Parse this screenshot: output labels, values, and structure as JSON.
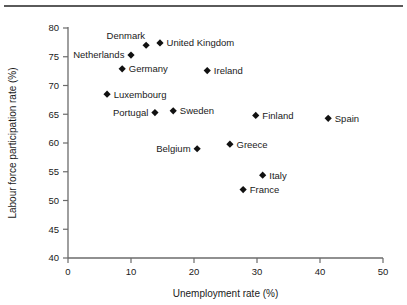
{
  "figure": {
    "has_top_rule": true,
    "background_color": "#ffffff",
    "marker_color": "#111111",
    "axis_color": "#6b6b6b",
    "text_color": "#1a1a1a"
  },
  "chart_data": {
    "type": "scatter",
    "title": "",
    "xlabel": "Unemployment rate (%)",
    "ylabel": "Labour force participation rate (%)",
    "xlim": [
      0,
      50
    ],
    "ylim": [
      40,
      80
    ],
    "xticks": [
      0,
      10,
      20,
      30,
      40,
      50
    ],
    "yticks": [
      40,
      45,
      50,
      55,
      60,
      65,
      70,
      75,
      80
    ],
    "xtick_labels": [
      "0",
      "10",
      "20",
      "30",
      "40",
      "50"
    ],
    "ytick_labels": [
      "40",
      "45",
      "50",
      "55",
      "60",
      "65",
      "70",
      "75",
      "80"
    ],
    "grid": false,
    "legend": false,
    "marker_shape": "diamond",
    "points": [
      {
        "label": "Denmark",
        "x": 12.4,
        "y": 77.0,
        "label_pos": "above-left"
      },
      {
        "label": "United Kingdom",
        "x": 14.6,
        "y": 77.4,
        "label_pos": "right"
      },
      {
        "label": "Netherlands",
        "x": 10.0,
        "y": 75.3,
        "label_pos": "left"
      },
      {
        "label": "Germany",
        "x": 8.6,
        "y": 72.9,
        "label_pos": "right"
      },
      {
        "label": "Ireland",
        "x": 22.1,
        "y": 72.6,
        "label_pos": "right"
      },
      {
        "label": "Luxembourg",
        "x": 6.2,
        "y": 68.5,
        "label_pos": "right"
      },
      {
        "label": "Portugal",
        "x": 13.8,
        "y": 65.3,
        "label_pos": "left"
      },
      {
        "label": "Sweden",
        "x": 16.7,
        "y": 65.6,
        "label_pos": "right"
      },
      {
        "label": "Finland",
        "x": 29.8,
        "y": 64.8,
        "label_pos": "right"
      },
      {
        "label": "Spain",
        "x": 41.3,
        "y": 64.3,
        "label_pos": "right"
      },
      {
        "label": "Belgium",
        "x": 20.5,
        "y": 59.0,
        "label_pos": "left"
      },
      {
        "label": "Greece",
        "x": 25.7,
        "y": 59.8,
        "label_pos": "right"
      },
      {
        "label": "Italy",
        "x": 30.9,
        "y": 54.4,
        "label_pos": "right"
      },
      {
        "label": "France",
        "x": 27.8,
        "y": 51.9,
        "label_pos": "right"
      }
    ]
  }
}
